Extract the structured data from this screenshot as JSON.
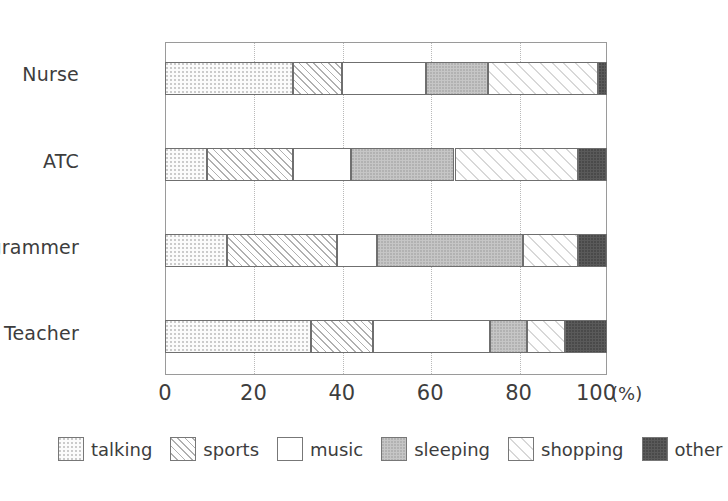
{
  "chart_data": {
    "type": "bar",
    "orientation": "horizontal",
    "stacked": true,
    "normalized_percent": true,
    "title": "",
    "xlabel": "(%)",
    "ylabel": "",
    "xlim": [
      0,
      100
    ],
    "xticks": [
      0,
      20,
      40,
      60,
      80,
      100
    ],
    "xtick_labels": [
      "0",
      "20",
      "40",
      "60",
      "80",
      "100"
    ],
    "x_unit_label": "(%)",
    "grid": "vertical-dotted",
    "legend_position": "bottom",
    "categories": [
      "Nurse",
      "ATC",
      "Programmer",
      "Teacher"
    ],
    "series": [
      {
        "name": "talking",
        "pattern": "dotted",
        "values": [
          29,
          9.5,
          14,
          33
        ]
      },
      {
        "name": "sports",
        "pattern": "diagonal-hatch",
        "values": [
          11,
          19.5,
          25,
          14
        ]
      },
      {
        "name": "music",
        "pattern": "solid-white",
        "values": [
          19,
          13,
          9,
          26.5
        ]
      },
      {
        "name": "sleeping",
        "pattern": "gray-fill",
        "values": [
          14,
          23.5,
          33,
          8.5
        ]
      },
      {
        "name": "shopping",
        "pattern": "light-diagonal",
        "values": [
          25,
          28,
          12.5,
          8.5
        ]
      },
      {
        "name": "other",
        "pattern": "dark-fill",
        "values": [
          2,
          6.5,
          6.5,
          9.5
        ]
      }
    ],
    "legend_entries": [
      "talking",
      "sports",
      "music",
      "sleeping",
      "shopping",
      "other"
    ]
  },
  "axis": {
    "x_unit": "(%)"
  }
}
